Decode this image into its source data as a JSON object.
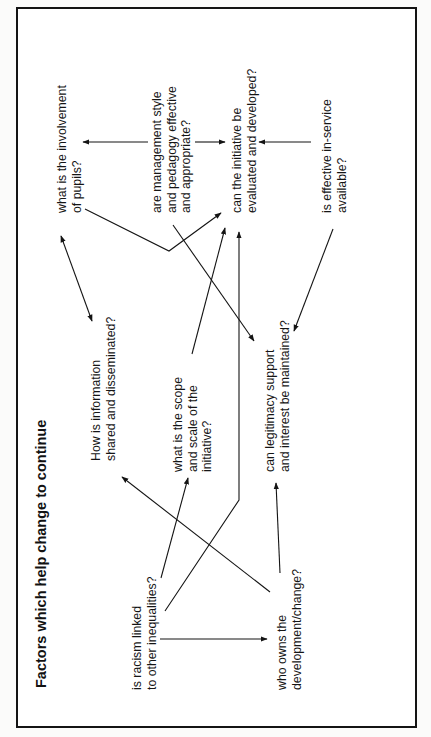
{
  "diagram": {
    "title": "Factors which help change to continue",
    "orientation": "rotated 90 degrees counter-clockwise",
    "colors": {
      "ink": "#141414",
      "background": "#ffffff"
    },
    "nodes": [
      {
        "id": "pupils",
        "lines": [
          "what is the involvement",
          "of pupils?"
        ]
      },
      {
        "id": "management",
        "lines": [
          "are management style",
          "and pedagogy effective",
          "and appropriate?"
        ]
      },
      {
        "id": "initiative",
        "lines": [
          "can the initiative be",
          "evaluated and developed?"
        ]
      },
      {
        "id": "inservice",
        "lines": [
          "is effective in-service",
          "available?"
        ]
      },
      {
        "id": "information",
        "lines": [
          "How is information",
          "shared and disseminated?"
        ]
      },
      {
        "id": "scope",
        "lines": [
          "what is the scope",
          "and scale of the",
          "initiative?"
        ]
      },
      {
        "id": "legitimacy",
        "lines": [
          "can legitimacy support",
          "and interest be maintained?"
        ]
      },
      {
        "id": "racism",
        "lines": [
          "is racism linked",
          "to other inequalities?"
        ]
      },
      {
        "id": "ownership",
        "lines": [
          "who owns the",
          "development/change?"
        ]
      }
    ],
    "edges": [
      {
        "from": "management",
        "to": "pupils",
        "type": "arrow"
      },
      {
        "from": "management",
        "to": "initiative",
        "type": "arrow"
      },
      {
        "from": "inservice",
        "to": "initiative",
        "type": "arrow"
      },
      {
        "from": "pupils",
        "to": "information",
        "type": "double-arrow"
      },
      {
        "from": "pupils",
        "to": "initiative",
        "type": "bent-arrow"
      },
      {
        "from": "management",
        "to": "legitimacy",
        "type": "arrow"
      },
      {
        "from": "scope",
        "to": "initiative",
        "type": "arrow"
      },
      {
        "from": "racism",
        "to": "initiative",
        "type": "bent-arrow"
      },
      {
        "from": "inservice",
        "to": "legitimacy",
        "type": "arrow"
      },
      {
        "from": "racism",
        "to": "scope",
        "type": "arrow"
      },
      {
        "from": "ownership",
        "to": "information",
        "type": "arrow"
      },
      {
        "from": "racism",
        "to": "ownership",
        "type": "arrow"
      },
      {
        "from": "ownership",
        "to": "legitimacy",
        "type": "arrow"
      }
    ]
  }
}
